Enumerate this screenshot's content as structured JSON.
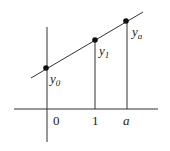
{
  "diagram": {
    "colors": {
      "line": "#333333",
      "point": "#111111",
      "text": "#222222"
    },
    "axes": {
      "x": {
        "x1": 14,
        "y": 109,
        "x2": 158
      },
      "y": {
        "x": 47,
        "y1": 27,
        "y2": 142
      }
    },
    "line": {
      "x1": 31,
      "y1": 78,
      "x2": 143,
      "y2": 12
    },
    "points": [
      {
        "id": "y0",
        "x": 46,
        "y": 68,
        "label_base": "y",
        "label_sub": "0",
        "label_x": 50,
        "label_y": 83
      },
      {
        "id": "y1",
        "x": 95,
        "y": 40,
        "label_base": "y",
        "label_sub": "1",
        "label_x": 99,
        "label_y": 55
      },
      {
        "id": "ya",
        "x": 126,
        "y": 21,
        "label_base": "y",
        "label_sub": "a",
        "label_x": 132,
        "label_y": 36
      }
    ],
    "verticals": [
      {
        "x": 95,
        "y1": 40,
        "y2": 109
      },
      {
        "x": 127,
        "y1": 21,
        "y2": 109
      }
    ],
    "x_ticks": [
      {
        "text": "0",
        "x": 53,
        "y": 125,
        "italic": false
      },
      {
        "text": "1",
        "x": 92,
        "y": 125,
        "italic": false
      },
      {
        "text": "a",
        "x": 123,
        "y": 125,
        "italic": true
      }
    ]
  }
}
